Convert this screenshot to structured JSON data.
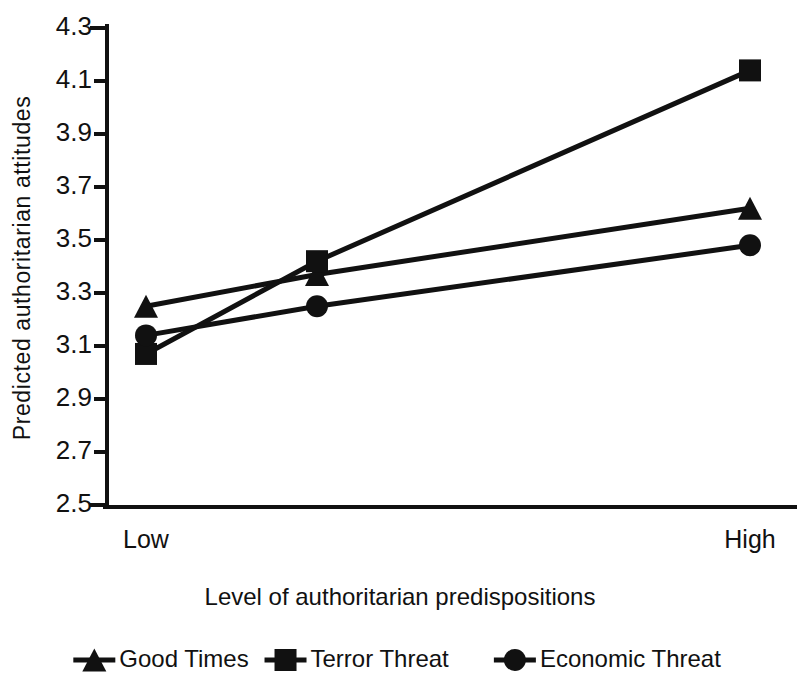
{
  "chart_data": {
    "type": "line",
    "title": "",
    "xlabel": "Level of authoritarian predispositions",
    "ylabel": "Predicted authoritarian attitudes",
    "categories": [
      "Low",
      "Medium",
      "High"
    ],
    "visible_category_labels": [
      "Low",
      "High"
    ],
    "ylim": [
      2.5,
      4.3
    ],
    "ytick_labels": [
      "4.3",
      "4.1",
      "3.9",
      "3.7",
      "3.5",
      "3.3",
      "3.1",
      "2.9",
      "2.7",
      "2.5"
    ],
    "yticks": [
      4.3,
      4.1,
      3.9,
      3.7,
      3.5,
      3.3,
      3.1,
      2.9,
      2.7,
      2.5
    ],
    "grid": false,
    "legend_position": "bottom",
    "series": [
      {
        "name": "Good Times",
        "marker": "triangle",
        "color": "#111111",
        "values": [
          3.25,
          3.37,
          3.62
        ]
      },
      {
        "name": "Terror Threat",
        "marker": "square",
        "color": "#111111",
        "values": [
          3.07,
          3.42,
          4.14
        ]
      },
      {
        "name": "Economic Threat",
        "marker": "circle",
        "color": "#111111",
        "values": [
          3.14,
          3.25,
          3.48
        ]
      }
    ]
  },
  "legend": {
    "items": [
      {
        "label": "Good Times",
        "marker": "triangle-icon"
      },
      {
        "label": "Terror Threat",
        "marker": "square-icon"
      },
      {
        "label": "Economic Threat",
        "marker": "circle-icon"
      }
    ]
  },
  "axes": {
    "y_title": "Predicted authoritarian attitudes",
    "x_title": "Level of authoritarian predispositions",
    "x_low_label": "Low",
    "x_high_label": "High"
  }
}
